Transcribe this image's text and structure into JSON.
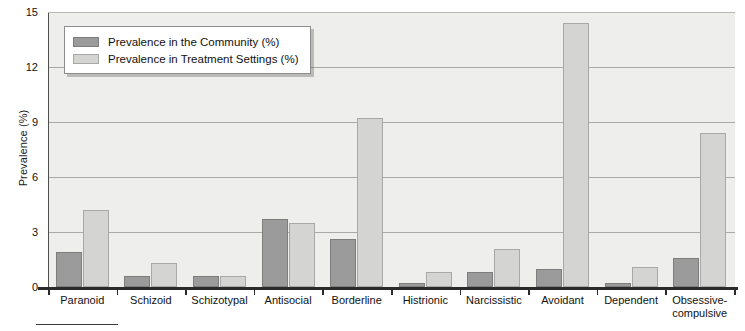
{
  "chart_data": {
    "type": "bar",
    "title": "",
    "xlabel": "",
    "ylabel": "Prevalence (%)",
    "ylim": [
      0,
      15
    ],
    "yticks": [
      0,
      3,
      6,
      9,
      12,
      15
    ],
    "grid": true,
    "legend_position": "upper-left-inside",
    "categories": [
      "Paranoid",
      "Schizoid",
      "Schizotypal",
      "Antisocial",
      "Borderline",
      "Histrionic",
      "Narcissistic",
      "Avoidant",
      "Dependent",
      "Obsessive-\ncompulsive"
    ],
    "series": [
      {
        "name": "Prevalence in the Community (%)",
        "color": "#9b9b9b",
        "values": [
          1.9,
          0.6,
          0.6,
          3.7,
          2.6,
          0.2,
          0.8,
          1.0,
          0.2,
          1.6
        ]
      },
      {
        "name": "Prevalence in Treatment Settings (%)",
        "color": "#d4d4d2",
        "values": [
          4.2,
          1.3,
          0.6,
          3.5,
          9.2,
          0.8,
          2.1,
          14.4,
          1.1,
          8.4
        ]
      }
    ]
  },
  "axis": {
    "y_title": "Prevalence (%)",
    "y_tick_labels": [
      "15",
      "12",
      "9",
      "6",
      "3",
      "0"
    ]
  },
  "legend": {
    "items": [
      {
        "label": "Prevalence in the Community (%)",
        "swatch": "community"
      },
      {
        "label": "Prevalence in Treatment Settings (%)",
        "swatch": "treatment"
      }
    ]
  }
}
